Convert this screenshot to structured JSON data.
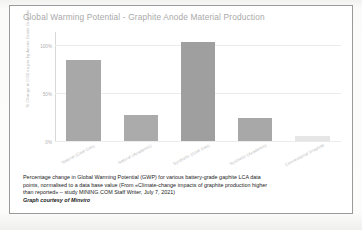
{
  "figure": {
    "title": "Global Warming Potential - Graphite Anode Material Production",
    "y_axis_title": "% Change in CO2 eq per kg Anode Grade Graphite",
    "caption_lines": [
      "Percentage change in Global Warming Potential (GWP) for various battery-grade gaphite LCA data",
      "points, normalised to a data base value (From «Climate-change impacts of graphite production higher",
      "than reported» – study MINING.COM Staff Writer, July 7, 2021)"
    ],
    "credit": "Graph courtesy of Minviro",
    "undertext": ""
  },
  "chart_data": {
    "type": "bar",
    "title": "Global Warming Potential - Graphite Anode Material Production",
    "xlabel": "",
    "ylabel": "% Change in CO2 eq per kg Anode Grade Graphite",
    "categories": [
      "Natural (Coal Gas)",
      "Natural (Academic)",
      "Synthetic (Coal Gas)",
      "Synthetic (Academic)",
      "Conventional Graphite"
    ],
    "values": [
      85,
      27,
      103,
      24,
      5
    ],
    "tick_labels": [
      "0%",
      "50%",
      "100%"
    ],
    "tick_values": [
      0,
      50,
      100
    ],
    "ylim": [
      0,
      115
    ],
    "grid": true,
    "legend": "none",
    "bar_colors": [
      "#a8a8a8",
      "#ababab",
      "#9f9f9f",
      "#a8a8a8",
      "#e6e6e6"
    ]
  }
}
